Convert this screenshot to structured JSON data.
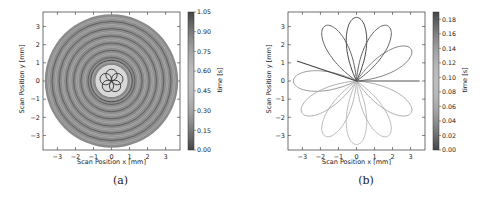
{
  "chart_data": [
    {
      "type": "line",
      "panel": "(a)",
      "description": "Concentric circular scan trajectory with central 5-lobe rosette, colored by time",
      "xlabel": "Scan Position x [mm]",
      "ylabel": "Scan Position y [mm]",
      "xlim": [
        -3.8,
        3.8
      ],
      "ylim": [
        -3.8,
        3.8
      ],
      "xticks": [
        -3,
        -2,
        -1,
        0,
        1,
        2,
        3
      ],
      "yticks": [
        -3,
        -2,
        -1,
        0,
        1,
        2,
        3
      ],
      "outer_radius_mm": 3.7,
      "inner_rosette_petals": 5,
      "inner_rosette_radius_mm": 0.75,
      "colorbar": {
        "label": "time [s]",
        "range": [
          0.0,
          1.05
        ],
        "ticks": [
          "0.00",
          "0.15",
          "0.30",
          "0.45",
          "0.60",
          "0.75",
          "0.90",
          "1.05"
        ]
      },
      "grid": false
    },
    {
      "type": "line",
      "panel": "(b)",
      "description": "12-petal rosette scan trajectory through origin, colored by time",
      "xlabel": "Scan Position x [mm]",
      "ylabel": "Scan Position y [mm]",
      "xlim": [
        -3.8,
        3.8
      ],
      "ylim": [
        -3.8,
        3.8
      ],
      "xticks": [
        -3,
        -2,
        -1,
        0,
        1,
        2,
        3
      ],
      "yticks": [
        -3,
        -2,
        -1,
        0,
        1,
        2,
        3
      ],
      "petals": 12,
      "petal_radius_mm": 3.5,
      "open_segment_ends": [
        [
          3.5,
          0.0
        ],
        [
          -3.3,
          1.1
        ]
      ],
      "colorbar": {
        "label": "time [s]",
        "range": [
          0.0,
          0.19
        ],
        "ticks": [
          "0.00",
          "0.02",
          "0.04",
          "0.06",
          "0.08",
          "0.10",
          "0.12",
          "0.14",
          "0.16",
          "0.18"
        ]
      },
      "grid": false
    }
  ],
  "panels": {
    "a": {
      "caption": "(a)",
      "xlabel": "Scan Position x [mm]",
      "ylabel": "Scan Position y [mm]",
      "cblabel": "time [s]"
    },
    "b": {
      "caption": "(b)",
      "xlabel": "Scan Position x [mm]",
      "ylabel": "Scan Position y [mm]",
      "cblabel": "time [s]"
    }
  }
}
